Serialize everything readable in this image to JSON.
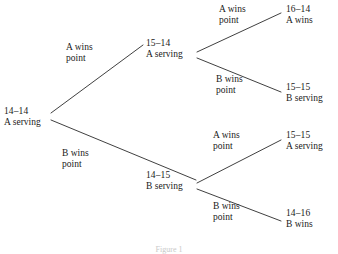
{
  "diagram": {
    "caption": "Figure 1",
    "line_color": "#2a2a2a",
    "text_color": "#1a1a1a",
    "background": "#ffffff",
    "nodes": [
      {
        "id": "root",
        "score": "14–14",
        "status": "A serving",
        "x": 4,
        "y": 106
      },
      {
        "id": "a-up",
        "score": "15–14",
        "status": "A serving",
        "x": 146,
        "y": 38
      },
      {
        "id": "b-down",
        "score": "14–15",
        "status": "B serving",
        "x": 146,
        "y": 170
      },
      {
        "id": "leaf-aa",
        "score": "16–14",
        "status": "A wins",
        "x": 286,
        "y": 4
      },
      {
        "id": "leaf-ab",
        "score": "15–15",
        "status": "B serving",
        "x": 286,
        "y": 82
      },
      {
        "id": "leaf-ba",
        "score": "15–15",
        "status": "A serving",
        "x": 286,
        "y": 130
      },
      {
        "id": "leaf-bb",
        "score": "14–16",
        "status": "B wins",
        "x": 286,
        "y": 208
      }
    ],
    "edge_labels": [
      {
        "id": "root-a",
        "line1": "A wins",
        "line2": "point",
        "x": 66,
        "y": 42
      },
      {
        "id": "root-b",
        "line1": "B wins",
        "line2": "point",
        "x": 62,
        "y": 148
      },
      {
        "id": "a-aa",
        "line1": "A wins",
        "line2": "point",
        "x": 219,
        "y": 4
      },
      {
        "id": "a-ab",
        "line1": "B wins",
        "line2": "point",
        "x": 216,
        "y": 74
      },
      {
        "id": "b-ba",
        "line1": "A wins",
        "line2": "point",
        "x": 213,
        "y": 130
      },
      {
        "id": "b-bb",
        "line1": "B wins",
        "line2": "point",
        "x": 213,
        "y": 201
      }
    ],
    "edges": [
      {
        "id": "edge-root-a",
        "x1": 51,
        "y1": 113,
        "x2": 143,
        "y2": 45
      },
      {
        "id": "edge-root-b",
        "x1": 51,
        "y1": 120,
        "x2": 196,
        "y2": 180
      },
      {
        "id": "edge-a-aa",
        "x1": 197,
        "y1": 52,
        "x2": 281,
        "y2": 13
      },
      {
        "id": "edge-a-ab",
        "x1": 197,
        "y1": 58,
        "x2": 281,
        "y2": 92
      },
      {
        "id": "edge-b-ba",
        "x1": 197,
        "y1": 183,
        "x2": 281,
        "y2": 140
      },
      {
        "id": "edge-b-bb",
        "x1": 197,
        "y1": 189,
        "x2": 281,
        "y2": 221
      }
    ]
  }
}
